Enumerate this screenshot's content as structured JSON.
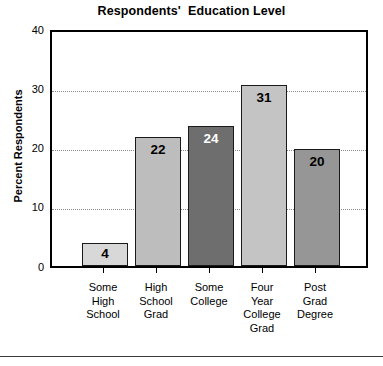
{
  "chart_data": {
    "type": "bar",
    "title": "Respondents'  Education Level",
    "xlabel": "",
    "ylabel": "Percent Respondents",
    "ylim": [
      0,
      40
    ],
    "yticks": [
      "0",
      "10",
      "20",
      "30",
      "40"
    ],
    "grid": "horizontal dotted gridlines at 10, 20, 30",
    "legend": "none",
    "categories": [
      "Some\nHigh\nSchool",
      "High\nSchool\nGrad",
      "Some\nCollege",
      "Four\nYear\nCollege\nGrad",
      "Post\nGrad\nDegree"
    ],
    "values": [
      4,
      22,
      24,
      31,
      20
    ],
    "data_labels": [
      "4",
      "22",
      "24",
      "31",
      "20"
    ],
    "bar_colors": [
      "#d8d8d8",
      "#bdbdbd",
      "#6e6e6e",
      "#c4c4c4",
      "#969696"
    ],
    "label_colors": [
      "#000000",
      "#000000",
      "#ffffff",
      "#000000",
      "#000000"
    ]
  },
  "axis": {
    "tick_40": "40",
    "tick_30": "30",
    "tick_20": "20",
    "tick_10": "10",
    "tick_0": "0"
  },
  "footer": {
    "clipped_caption": ""
  }
}
